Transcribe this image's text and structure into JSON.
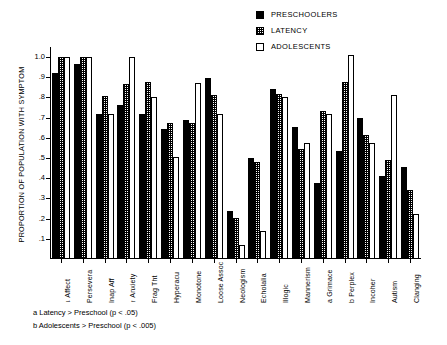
{
  "legend": {
    "items": [
      {
        "label": "PRESCHOOLERS",
        "swatch": "solid-black-square-icon"
      },
      {
        "label": "LATENCY",
        "swatch": "stippled-square-icon"
      },
      {
        "label": "ADOLESCENTS",
        "swatch": "open-white-square-icon"
      }
    ]
  },
  "footnotes": [
    "a Latency > Preschool (p < .05)",
    "b Adolescents > Preschool (p < .005)"
  ],
  "chart_data": {
    "type": "bar",
    "title": "",
    "xlabel": "",
    "ylabel": "PROPORTION OF POPULATION WITH SYMPTOM",
    "ylim": [
      0,
      1.05
    ],
    "yticks": [
      0.1,
      0.2,
      0.3,
      0.4,
      0.5,
      0.6,
      0.7,
      0.8,
      0.9,
      1.0
    ],
    "ytick_labels": [
      ".1",
      ".2",
      ".3",
      ".4",
      ".5",
      ".6",
      ".7",
      ".8",
      ".9",
      "1.0"
    ],
    "grid": false,
    "legend_position": "top-right",
    "categories": [
      "↓ Affect",
      "Persevera",
      "Inap Aff",
      "↑ Anxiety",
      "Frag Tht",
      "Hyperacu",
      "Monotone",
      "Loose Assoc",
      "Neologism",
      "Echolalia",
      "Illogic",
      "Mannerism",
      "a  Grimace",
      "b  Perplex",
      "Incoher",
      "Autism",
      "Clanging"
    ],
    "series": [
      {
        "name": "PRESCHOOLERS",
        "color": "#000000",
        "values": [
          0.92,
          0.965,
          0.72,
          0.765,
          0.72,
          0.645,
          0.69,
          0.895,
          0.24,
          0.5,
          0.84,
          0.655,
          0.375,
          0.535,
          0.7,
          0.41,
          0.455
        ]
      },
      {
        "name": "LATENCY",
        "color": "#cccccc",
        "values": [
          1.0,
          1.0,
          0.805,
          0.865,
          0.875,
          0.675,
          0.675,
          0.81,
          0.205,
          0.48,
          0.815,
          0.545,
          0.735,
          0.875,
          0.615,
          0.49,
          0.34
        ]
      },
      {
        "name": "ADOLESCENTS",
        "color": "#ffffff",
        "values": [
          1.0,
          1.0,
          0.72,
          1.0,
          0.8,
          0.505,
          0.87,
          0.72,
          0.07,
          0.14,
          0.8,
          0.575,
          0.72,
          1.01,
          0.575,
          0.81,
          0.225
        ]
      }
    ]
  }
}
